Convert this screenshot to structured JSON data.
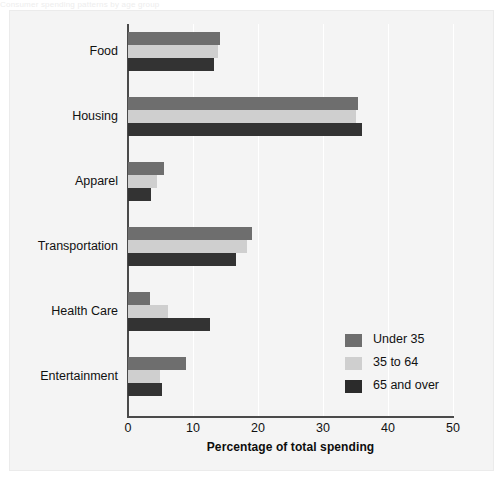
{
  "figure": {
    "clipped_top_title": "Consumer spending patterns by age group"
  },
  "chart_data": {
    "type": "bar",
    "orientation": "horizontal",
    "title": "",
    "xlabel": "Percentage of total spending",
    "ylabel": "",
    "xlim": [
      0,
      50
    ],
    "xticks": [
      0,
      10,
      20,
      30,
      40,
      50
    ],
    "xtick_labels": [
      "0",
      "10",
      "20",
      "30",
      "40",
      "50"
    ],
    "grid": true,
    "grid_axis": "x",
    "legend_position": "lower right",
    "categories": [
      "Food",
      "Housing",
      "Apparel",
      "Transportation",
      "Health Care",
      "Entertainment"
    ],
    "series": [
      {
        "name": "Under 35",
        "color": "#6e6e6e",
        "values": [
          14.2,
          35.4,
          5.5,
          19.0,
          3.4,
          8.9
        ]
      },
      {
        "name": "35 to 64",
        "color": "#cfcfcf",
        "values": [
          13.8,
          35.1,
          4.5,
          18.3,
          6.2,
          4.9
        ]
      },
      {
        "name": "65 and over",
        "color": "#2b2b2b",
        "values": [
          13.2,
          36.0,
          3.5,
          16.6,
          12.6,
          5.2
        ]
      }
    ]
  }
}
